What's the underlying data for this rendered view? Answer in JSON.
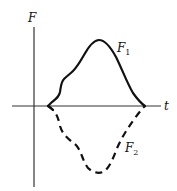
{
  "diagram": {
    "axes": {
      "y_label": "F",
      "x_label": "t"
    },
    "curves": [
      {
        "name": "F",
        "subscript": "1",
        "style": "solid",
        "position": "above time axis"
      },
      {
        "name": "F",
        "subscript": "2",
        "style": "dashed",
        "position": "below time axis"
      }
    ],
    "colors": {
      "ink": "#111111",
      "axis": "#333333",
      "background": "#ffffff"
    }
  }
}
